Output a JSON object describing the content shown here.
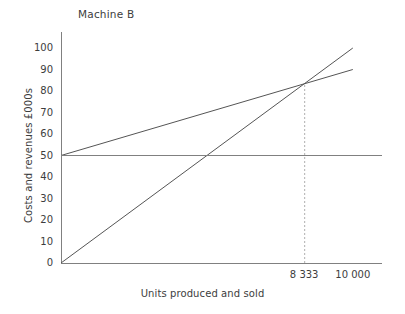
{
  "chart_data": {
    "type": "line",
    "title": "Machine B",
    "xlabel": "Units produced and sold",
    "ylabel": "Costs and revenues £000s",
    "xlim": [
      0,
      11000
    ],
    "ylim": [
      0,
      100
    ],
    "grid": false,
    "legend": "none",
    "y_ticks": [
      0,
      10,
      20,
      30,
      40,
      50,
      60,
      70,
      80,
      90,
      100
    ],
    "y_tick_labels": [
      "0",
      "10",
      "20",
      "30",
      "40",
      "50",
      "60",
      "70",
      "80",
      "90",
      "100"
    ],
    "x_ticks": [
      8333,
      10000
    ],
    "x_tick_labels": [
      "8 333",
      "10 000"
    ],
    "series": [
      {
        "name": "revenue",
        "points": [
          [
            0,
            0
          ],
          [
            10000,
            100
          ]
        ],
        "style": "solid",
        "color": "#555555"
      },
      {
        "name": "total-cost",
        "points": [
          [
            0,
            50
          ],
          [
            10000,
            90
          ]
        ],
        "style": "solid",
        "color": "#555555"
      },
      {
        "name": "fixed-cost",
        "points": [
          [
            0,
            50
          ],
          [
            11000,
            50
          ]
        ],
        "style": "solid",
        "color": "#808080"
      }
    ],
    "annotations": [
      {
        "name": "break-even-marker",
        "type": "vertical-dashed-line",
        "x": 8333,
        "y_from": 0,
        "y_to": 83.3,
        "label": "8 333",
        "color": "#b0b0b0"
      }
    ],
    "axis_color": "#808080",
    "text_color": "#3d3d3d"
  }
}
